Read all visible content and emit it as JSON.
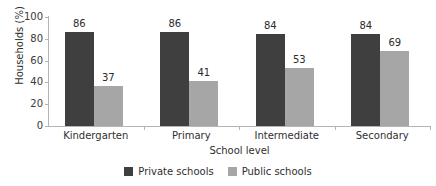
{
  "chart_data": {
    "type": "bar",
    "title": "",
    "xlabel": "School level",
    "ylabel": "Households (%)",
    "categories": [
      "Kindergarten",
      "Primary",
      "Intermediate",
      "Secondary"
    ],
    "series": [
      {
        "name": "Private schools",
        "color": "#3f3f3f",
        "values": [
          86,
          86,
          84,
          84
        ]
      },
      {
        "name": "Public schools",
        "color": "#a6a6a6",
        "values": [
          37,
          41,
          53,
          69
        ]
      }
    ],
    "ylim": [
      0,
      100
    ],
    "yticks": [
      0,
      20,
      40,
      60,
      80,
      100
    ],
    "ytick_labels": [
      "0",
      "20",
      "40",
      "60",
      "80",
      "100"
    ],
    "grid": false,
    "legend_position": "bottom",
    "data_labels": true,
    "axis_color": "#b4b4b4",
    "background": "#ffffff"
  },
  "legend": {
    "items": [
      {
        "label": "Private schools"
      },
      {
        "label": "Public schools"
      }
    ]
  }
}
